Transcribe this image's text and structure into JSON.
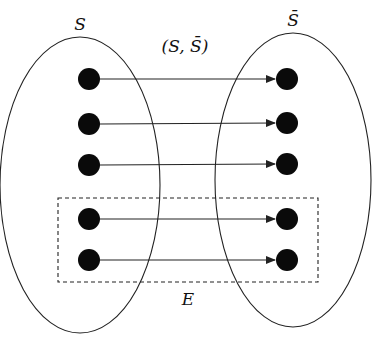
{
  "diagram": {
    "type": "bipartite-cut",
    "sets": [
      {
        "id": "S",
        "label": "S",
        "cx": 80,
        "cy": 185,
        "rx": 80,
        "ry": 148,
        "label_x": 80,
        "label_y": 30
      },
      {
        "id": "S_bar",
        "label": "S̄",
        "cx": 293,
        "cy": 180,
        "rx": 78,
        "ry": 147,
        "label_x": 293,
        "label_y": 26
      }
    ],
    "cut_label": {
      "text": "(S, S̄)",
      "x": 185,
      "y": 52
    },
    "edge_set": {
      "label": "E",
      "x": 188,
      "y": 305,
      "rect": {
        "x": 58,
        "y": 198,
        "w": 260,
        "h": 84
      }
    },
    "nodes_left": [
      {
        "x": 89,
        "y": 79
      },
      {
        "x": 89,
        "y": 124
      },
      {
        "x": 89,
        "y": 165
      },
      {
        "x": 89,
        "y": 219
      },
      {
        "x": 89,
        "y": 260
      }
    ],
    "nodes_right": [
      {
        "x": 287,
        "y": 79
      },
      {
        "x": 287,
        "y": 123
      },
      {
        "x": 287,
        "y": 164
      },
      {
        "x": 287,
        "y": 219
      },
      {
        "x": 287,
        "y": 260
      }
    ],
    "edges": [
      {
        "from": 0,
        "to": 0
      },
      {
        "from": 1,
        "to": 1
      },
      {
        "from": 2,
        "to": 2
      },
      {
        "from": 3,
        "to": 3
      },
      {
        "from": 4,
        "to": 4
      }
    ],
    "node_radius": 11,
    "colors": {
      "stroke": "#222222",
      "node": "#0a0a0a",
      "background": "#ffffff"
    }
  }
}
